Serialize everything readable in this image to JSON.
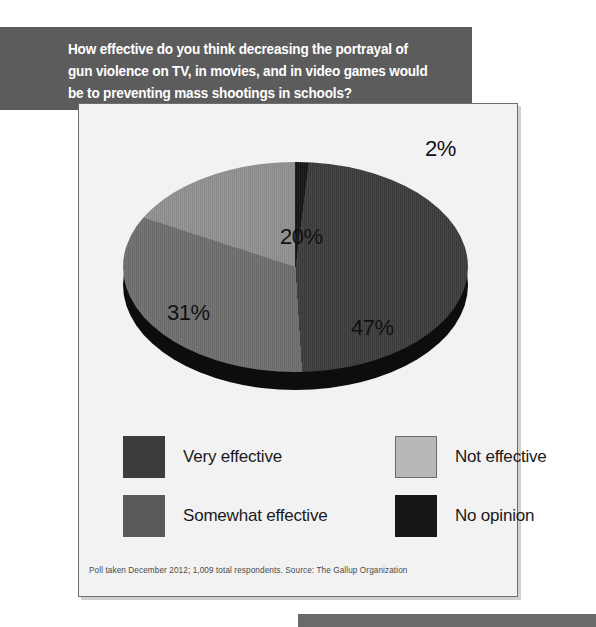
{
  "top_ghost_text": "                                                 ",
  "banner": {
    "question": "How effective do you think decreasing the portrayal of\ngun violence on TV, in movies, and in video games would\nbe to preventing mass shootings in schools?",
    "background": "#5c5c5c",
    "text_color": "#ffffff"
  },
  "panel": {
    "background": "#f2f2f2",
    "border_color": "#6f6f6f"
  },
  "chart_data": {
    "type": "pie",
    "title": "How effective do you think decreasing the portrayal of gun violence on TV, in movies, and in video games would be to preventing mass shootings in schools?",
    "categories": [
      "Very effective",
      "Somewhat effective",
      "Not effective",
      "No opinion"
    ],
    "values": [
      47,
      31,
      20,
      2
    ],
    "value_labels": [
      "47%",
      "31%",
      "20%",
      "2%"
    ],
    "colors": [
      "#3c3c3c",
      "#6e6e6e",
      "#8f8f8f",
      "#161616"
    ],
    "legend_position": "bottom",
    "grid": false,
    "xlabel": "",
    "ylabel": "",
    "annotations": [
      "Poll taken December 2012; 1,009 total respondents. Source: The Gallup Organization"
    ],
    "style": "3d-pie"
  },
  "legend": [
    {
      "label": "Very effective",
      "color": "#3c3c3c",
      "bordered": false
    },
    {
      "label": "Somewhat effective",
      "color": "#595959",
      "bordered": false
    },
    {
      "label": "Not effective",
      "color": "#b8b8b8",
      "bordered": true
    },
    {
      "label": "No opinion",
      "color": "#161616",
      "bordered": false
    }
  ],
  "footnote": "Poll taken December 2012; 1,009 total respondents. Source: The Gallup Organization"
}
